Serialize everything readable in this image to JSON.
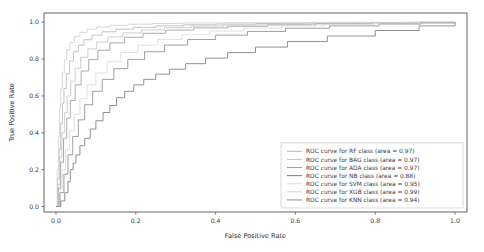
{
  "chart_data": {
    "type": "line",
    "title": "",
    "xlabel": "False Positive Rate",
    "ylabel": "True Positive Rate",
    "xlim": [
      -0.03,
      1.03
    ],
    "ylim": [
      -0.03,
      1.05
    ],
    "xticks": [
      "0.0",
      "0.2",
      "0.4",
      "0.6",
      "0.8",
      "1.0"
    ],
    "xtick_values": [
      0.0,
      0.2,
      0.4,
      0.6,
      0.8,
      1.0
    ],
    "yticks": [
      "0.0",
      "0.2",
      "0.4",
      "0.6",
      "0.8",
      "1.0"
    ],
    "ytick_values": [
      0.0,
      0.2,
      0.4,
      0.6,
      0.8,
      1.0
    ],
    "grid": false,
    "legend_position": "lower right",
    "series": [
      {
        "name": "RF",
        "label": "ROC curve for RF class (area = 0.97)",
        "area": 0.97,
        "color": "#b9b9b9",
        "x": [
          0.0,
          0.004,
          0.008,
          0.012,
          0.016,
          0.02,
          0.026,
          0.034,
          0.044,
          0.056,
          0.07,
          0.09,
          0.115,
          0.15,
          0.195,
          0.25,
          0.32,
          0.4,
          0.5,
          0.62,
          0.76,
          0.88,
          1.0
        ],
        "y": [
          0.0,
          0.15,
          0.31,
          0.45,
          0.56,
          0.64,
          0.72,
          0.79,
          0.84,
          0.875,
          0.905,
          0.93,
          0.948,
          0.962,
          0.972,
          0.98,
          0.986,
          0.99,
          0.993,
          0.996,
          0.998,
          0.999,
          1.0
        ]
      },
      {
        "name": "BAG",
        "label": "ROC curve for BAG class (area = 0.97)",
        "area": 0.97,
        "color": "#c6c6c6",
        "x": [
          0.0,
          0.005,
          0.01,
          0.015,
          0.021,
          0.028,
          0.037,
          0.048,
          0.062,
          0.08,
          0.102,
          0.13,
          0.168,
          0.215,
          0.272,
          0.34,
          0.42,
          0.52,
          0.64,
          0.78,
          0.9,
          1.0
        ],
        "y": [
          0.0,
          0.12,
          0.27,
          0.4,
          0.51,
          0.6,
          0.68,
          0.75,
          0.81,
          0.855,
          0.892,
          0.92,
          0.942,
          0.958,
          0.97,
          0.979,
          0.985,
          0.99,
          0.994,
          0.997,
          0.999,
          1.0
        ]
      },
      {
        "name": "ADA",
        "label": "ROC curve for ADA class (area = 0.97)",
        "area": 0.97,
        "color": "#9e9e9e",
        "x": [
          0.0,
          0.006,
          0.012,
          0.019,
          0.027,
          0.036,
          0.048,
          0.063,
          0.082,
          0.105,
          0.135,
          0.172,
          0.218,
          0.275,
          0.345,
          0.43,
          0.53,
          0.65,
          0.79,
          0.91,
          1.0
        ],
        "y": [
          0.0,
          0.1,
          0.24,
          0.37,
          0.48,
          0.575,
          0.66,
          0.735,
          0.798,
          0.848,
          0.888,
          0.918,
          0.94,
          0.957,
          0.969,
          0.978,
          0.985,
          0.991,
          0.996,
          0.999,
          1.0
        ]
      },
      {
        "name": "NB",
        "label": "ROC curve for NB class (area = 0.88)",
        "area": 0.88,
        "color": "#7d7d7d",
        "x": [
          0.0,
          0.012,
          0.022,
          0.03,
          0.036,
          0.043,
          0.05,
          0.06,
          0.072,
          0.086,
          0.1,
          0.118,
          0.135,
          0.152,
          0.172,
          0.195,
          0.22,
          0.25,
          0.285,
          0.325,
          0.375,
          0.43,
          0.5,
          0.58,
          0.68,
          0.8,
          0.91,
          1.0
        ],
        "y": [
          0.0,
          0.03,
          0.075,
          0.135,
          0.2,
          0.235,
          0.28,
          0.33,
          0.37,
          0.42,
          0.465,
          0.51,
          0.548,
          0.59,
          0.625,
          0.66,
          0.69,
          0.718,
          0.745,
          0.775,
          0.805,
          0.835,
          0.865,
          0.895,
          0.925,
          0.955,
          0.98,
          1.0
        ]
      },
      {
        "name": "SVM",
        "label": "ROC curve for SVM class (area = 0.95)",
        "area": 0.95,
        "color": "#dcdcdc",
        "x": [
          0.0,
          0.008,
          0.016,
          0.024,
          0.034,
          0.046,
          0.06,
          0.078,
          0.1,
          0.128,
          0.162,
          0.205,
          0.255,
          0.315,
          0.385,
          0.47,
          0.565,
          0.675,
          0.8,
          0.91,
          1.0
        ],
        "y": [
          0.0,
          0.09,
          0.2,
          0.31,
          0.41,
          0.5,
          0.585,
          0.66,
          0.725,
          0.785,
          0.835,
          0.875,
          0.906,
          0.932,
          0.952,
          0.968,
          0.98,
          0.989,
          0.995,
          0.998,
          1.0
        ]
      },
      {
        "name": "XGB",
        "label": "ROC curve for XGB class (area = 0.99)",
        "area": 0.99,
        "color": "#d2d2d2",
        "x": [
          0.0,
          0.003,
          0.006,
          0.009,
          0.012,
          0.016,
          0.021,
          0.027,
          0.035,
          0.046,
          0.06,
          0.078,
          0.102,
          0.135,
          0.18,
          0.24,
          0.32,
          0.43,
          0.57,
          0.74,
          0.9,
          1.0
        ],
        "y": [
          0.0,
          0.2,
          0.38,
          0.53,
          0.64,
          0.725,
          0.795,
          0.85,
          0.89,
          0.922,
          0.945,
          0.962,
          0.974,
          0.983,
          0.989,
          0.993,
          0.996,
          0.998,
          0.999,
          0.9995,
          1.0,
          1.0
        ]
      },
      {
        "name": "KNN",
        "label": "ROC curve for KNN class (area = 0.94)",
        "area": 0.94,
        "color": "#8e8e8e",
        "x": [
          0.0,
          0.01,
          0.02,
          0.03,
          0.042,
          0.056,
          0.072,
          0.092,
          0.116,
          0.145,
          0.18,
          0.222,
          0.272,
          0.33,
          0.4,
          0.48,
          0.575,
          0.685,
          0.81,
          0.915,
          1.0
        ],
        "y": [
          0.0,
          0.075,
          0.175,
          0.28,
          0.38,
          0.47,
          0.552,
          0.625,
          0.69,
          0.748,
          0.798,
          0.84,
          0.876,
          0.906,
          0.93,
          0.95,
          0.967,
          0.98,
          0.99,
          0.996,
          1.0
        ]
      }
    ]
  },
  "legend": {
    "entries": [
      {
        "label": "ROC curve for RF class (area = 0.97)",
        "color": "#b9b9b9"
      },
      {
        "label": "ROC curve for BAG class (area = 0.97)",
        "color": "#c6c6c6"
      },
      {
        "label": "ROC curve for ADA class (area = 0.97)",
        "color": "#9e9e9e"
      },
      {
        "label": "ROC curve for NB class (area = 0.88)",
        "color": "#7d7d7d"
      },
      {
        "label": "ROC curve for SVM class (area = 0.95)",
        "color": "#dcdcdc"
      },
      {
        "label": "ROC curve for XGB class (area = 0.99)",
        "color": "#d2d2d2"
      },
      {
        "label": "ROC curve for KNN class (area = 0.94)",
        "color": "#8e8e8e"
      }
    ]
  },
  "style": {
    "background": "#ffffff",
    "spine_color": "#555555",
    "text_color": "#3b3b3b",
    "legend_border": "#c9c9c9"
  }
}
